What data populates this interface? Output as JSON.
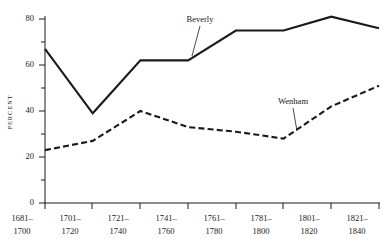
{
  "chart_data": {
    "type": "line",
    "title": "",
    "xlabel": "",
    "ylabel": "PERCENT",
    "categories": [
      "1681–\n1700",
      "1701–\n1720",
      "1721–\n1740",
      "1741–\n1760",
      "1761–\n1780",
      "1781–\n1800",
      "1801–\n1820",
      "1821–\n1840"
    ],
    "category_lines": [
      [
        "1681–",
        "1700"
      ],
      [
        "1701–",
        "1720"
      ],
      [
        "1721–",
        "1740"
      ],
      [
        "1741–",
        "1760"
      ],
      [
        "1761–",
        "1780"
      ],
      [
        "1781–",
        "1800"
      ],
      [
        "1801–",
        "1820"
      ],
      [
        "1821–",
        "1840"
      ]
    ],
    "ylim": [
      0,
      80
    ],
    "ytick_values": [
      0,
      20,
      40,
      60,
      80
    ],
    "ytick_labels": [
      "0",
      "20",
      "40",
      "60",
      "80"
    ],
    "yminor_values": [
      10,
      30,
      50,
      70
    ],
    "grid": false,
    "legend_position": "inline-annotation",
    "series": [
      {
        "name": "Beverly",
        "style": "solid",
        "color": "#1a1a1a",
        "values": [
          67,
          39,
          62,
          62,
          75,
          75,
          81,
          76
        ]
      },
      {
        "name": "Wenham",
        "style": "dashed",
        "color": "#1a1a1a",
        "values": [
          23,
          27,
          40,
          33,
          31,
          28,
          42,
          51
        ]
      }
    ],
    "annotations": [
      {
        "text": "Beverly",
        "series": "Beverly"
      },
      {
        "text": "Wenham",
        "series": "Wenham"
      }
    ]
  }
}
